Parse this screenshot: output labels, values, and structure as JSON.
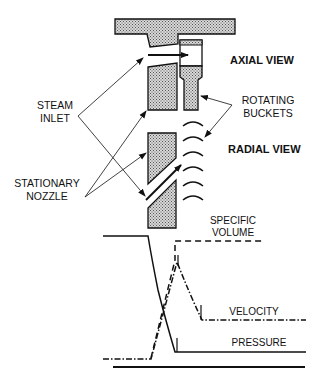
{
  "labels": {
    "axial_view": "AXIAL VIEW",
    "radial_view": "RADIAL VIEW",
    "steam_inlet_1": "STEAM",
    "steam_inlet_2": "INLET",
    "rotating_buckets_1": "ROTATING",
    "rotating_buckets_2": "BUCKETS",
    "stationary_nozzle_1": "STATIONARY",
    "stationary_nozzle_2": "NOZZLE",
    "specific_volume_1": "SPECIFIC",
    "specific_volume_2": "VOLUME",
    "velocity": "VELOCITY",
    "pressure": "PRESSURE"
  },
  "colors": {
    "ink": "#111111",
    "hatch_fill": "#bdbdbd"
  }
}
